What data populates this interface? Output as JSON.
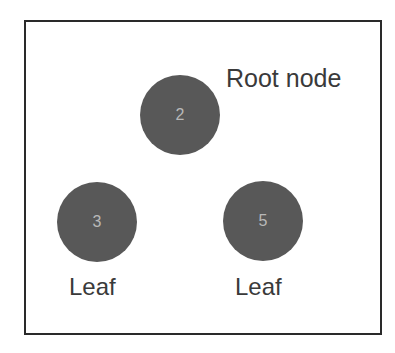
{
  "diagram": {
    "type": "tree",
    "root": {
      "value": "2",
      "label": "Root node"
    },
    "leaves": [
      {
        "value": "3",
        "label": "Leaf"
      },
      {
        "value": "5",
        "label": "Leaf"
      }
    ],
    "colors": {
      "node_fill": "#585858",
      "node_text": "#b8b8b8",
      "label_text": "#3a3a3a",
      "frame_border": "#2a2a2a",
      "background": "#ffffff"
    }
  }
}
